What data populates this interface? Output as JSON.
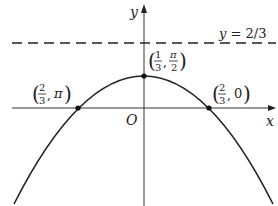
{
  "diagram": {
    "axes": {
      "x_label": "x",
      "y_label": "y",
      "origin_label": "O"
    },
    "asymptote": {
      "label": "y = 2/3",
      "style": "dashed"
    },
    "points": [
      {
        "name": "vertex",
        "label_num": "1",
        "label_den": "3",
        "label_second": "π",
        "label_second_den": "2"
      },
      {
        "name": "left-intercept",
        "label_num": "2",
        "label_den": "3",
        "label_second": "π"
      },
      {
        "name": "right-intercept",
        "label_num": "2",
        "label_den": "3",
        "label_second": "0"
      }
    ],
    "colors": {
      "stroke": "#222222",
      "background": "#ffffff"
    }
  }
}
